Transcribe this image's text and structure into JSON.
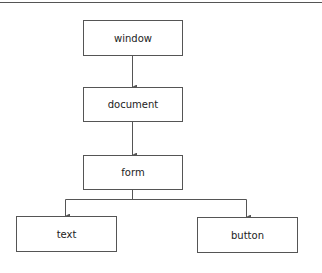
{
  "diagram": {
    "type": "tree",
    "nodes": [
      {
        "id": "window",
        "label": "window"
      },
      {
        "id": "document",
        "label": "document"
      },
      {
        "id": "form",
        "label": "form"
      },
      {
        "id": "text",
        "label": "text"
      },
      {
        "id": "button",
        "label": "button"
      }
    ],
    "edges": [
      {
        "from": "window",
        "to": "document"
      },
      {
        "from": "document",
        "to": "form"
      },
      {
        "from": "form",
        "to": "text"
      },
      {
        "from": "form",
        "to": "button"
      }
    ],
    "colors": {
      "line": "#555555",
      "text": "#222222",
      "background": "#ffffff"
    }
  }
}
